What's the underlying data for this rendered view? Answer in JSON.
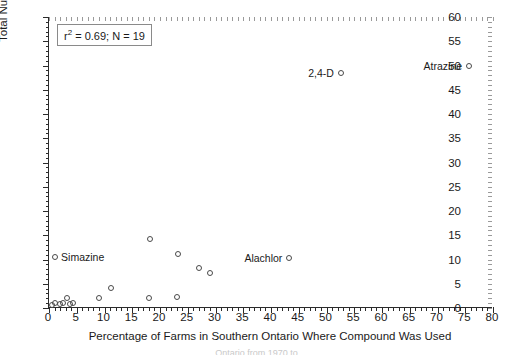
{
  "chart_data": {
    "type": "scatter",
    "title": "",
    "xlabel": "Percentage of Farms in Southern Ontario Where Compound Was Used",
    "ylabel": "Total Number of Accidental Releases in Ontario",
    "xlim": [
      0,
      80
    ],
    "ylim": [
      0,
      60
    ],
    "xticks": [
      0,
      5,
      10,
      15,
      20,
      25,
      30,
      35,
      40,
      45,
      50,
      55,
      60,
      65,
      70,
      75,
      80
    ],
    "yticks": [
      0,
      5,
      10,
      15,
      20,
      25,
      30,
      35,
      40,
      45,
      50,
      55,
      60
    ],
    "x_minor_step": 1,
    "y_minor_step": 1,
    "grid": false,
    "legend": "none",
    "marker": "open-circle",
    "annotation": {
      "r_squared_label": "r",
      "r_squared_exponent": "2",
      "r_squared_text": " = 0.69; N = 19",
      "full_text": "r2 = 0.69; N = 19",
      "r_squared": 0.69,
      "n": 19
    },
    "points": [
      {
        "label": "",
        "x": 1.0,
        "y": 1.0
      },
      {
        "label": "",
        "x": 2.0,
        "y": 0.8
      },
      {
        "label": "",
        "x": 2.6,
        "y": 1.0
      },
      {
        "label": "",
        "x": 3.2,
        "y": 2.0
      },
      {
        "label": "",
        "x": 3.8,
        "y": 0.9
      },
      {
        "label": "",
        "x": 4.3,
        "y": 1.0
      },
      {
        "label": "Simazine",
        "x": 1.1,
        "y": 10.6
      },
      {
        "label": "",
        "x": 9.0,
        "y": 2.0
      },
      {
        "label": "",
        "x": 11.2,
        "y": 4.1
      },
      {
        "label": "",
        "x": 18.0,
        "y": 2.1
      },
      {
        "label": "",
        "x": 18.2,
        "y": 14.3
      },
      {
        "label": "",
        "x": 23.0,
        "y": 2.2
      },
      {
        "label": "",
        "x": 23.2,
        "y": 11.1
      },
      {
        "label": "",
        "x": 27.0,
        "y": 8.2
      },
      {
        "label": "",
        "x": 29.0,
        "y": 7.3
      },
      {
        "label": "Alachlor",
        "x": 43.3,
        "y": 10.4
      },
      {
        "label": "2,4-D",
        "x": 52.6,
        "y": 48.4
      },
      {
        "label": "Atrazine",
        "x": 75.7,
        "y": 49.8
      },
      {
        "label": "",
        "x": 0.6,
        "y": 0.6
      }
    ],
    "point_labels": [
      {
        "text": "Simazine",
        "x": 1.1,
        "y": 10.6,
        "placement": "right"
      },
      {
        "text": "Alachlor",
        "x": 43.3,
        "y": 10.4,
        "placement": "left"
      },
      {
        "text": "2,4-D",
        "x": 52.6,
        "y": 48.4,
        "placement": "left"
      },
      {
        "text": "Atrazine",
        "x": 75.7,
        "y": 49.8,
        "placement": "left"
      }
    ],
    "colors": {
      "axis": "#2b2b2b",
      "marker_stroke": "#4a4a4a",
      "text": "#1a1a1a",
      "background": "#ffffff"
    }
  },
  "caption": {
    "fragment": "Ontario from 1970 to"
  }
}
